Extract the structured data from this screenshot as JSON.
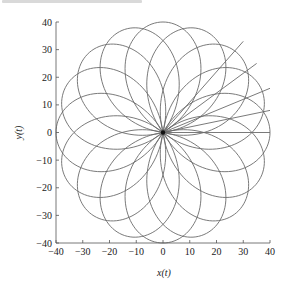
{
  "chart_data": {
    "type": "line",
    "title": "",
    "xlabel": "x(t)",
    "ylabel": "y(t)",
    "xlim": [
      -40,
      40
    ],
    "ylim": [
      -40,
      40
    ],
    "xticks": [
      -40,
      -30,
      -20,
      -10,
      0,
      10,
      20,
      30,
      40
    ],
    "yticks": [
      40,
      30,
      20,
      10,
      0,
      -10,
      -20,
      -30,
      -40
    ],
    "xtick_labels": [
      "−40",
      "−30",
      "−20",
      "−10",
      "0",
      "10",
      "20",
      "30",
      "40"
    ],
    "ytick_labels": [
      "40",
      "30",
      "20",
      "10",
      "0",
      "−10",
      "−20",
      "−30",
      "−40"
    ],
    "grid": false,
    "legend": "none",
    "series": [
      {
        "name": "rose-petals",
        "description": "16 overlapping petal loops through the origin, max radius 40",
        "petal_count": 16,
        "petal_angles_deg": [
          0,
          22.5,
          45,
          67.5,
          90,
          112.5,
          135,
          157.5,
          180,
          202.5,
          225,
          247.5,
          270,
          292.5,
          315,
          337.5
        ],
        "max_radius": 40,
        "color": "#6b6b6b"
      },
      {
        "name": "radial-rays",
        "description": "straight rays from the origin in the first quadrant",
        "ray_angles_deg": [
          0,
          11,
          22,
          35,
          48
        ],
        "ray_end_points": [
          [
            40,
            0
          ],
          [
            40,
            8
          ],
          [
            40,
            16
          ],
          [
            35,
            25
          ],
          [
            30,
            33
          ]
        ],
        "color": "#6b6b6b"
      }
    ]
  }
}
